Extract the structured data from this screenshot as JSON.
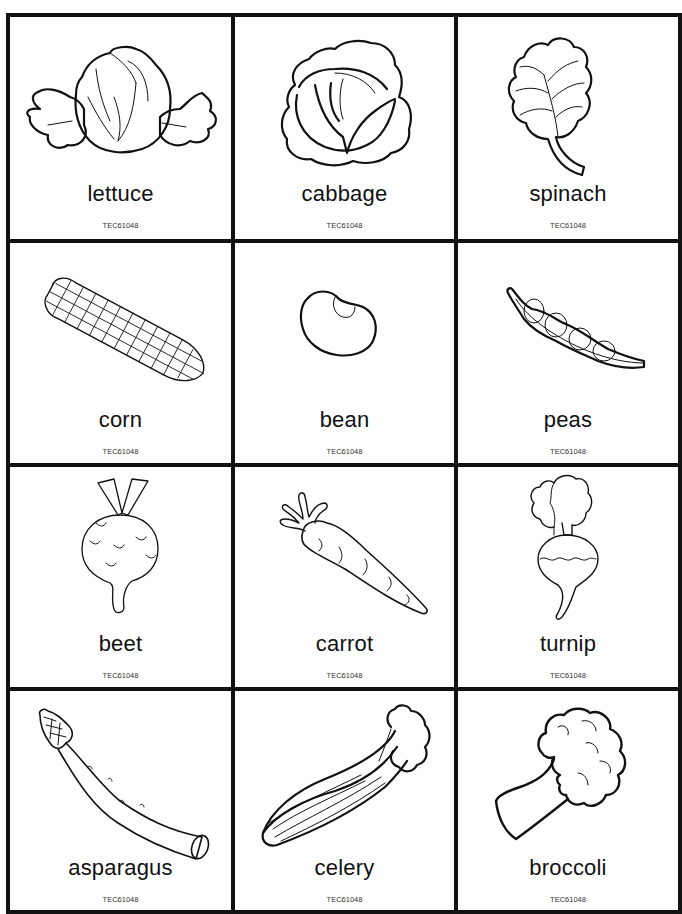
{
  "sheet": {
    "border_color": "#111111",
    "columns": 3,
    "rows": 4,
    "cards": [
      {
        "name": "lettuce",
        "label": "lettuce",
        "code": "TEC61048",
        "icon": "lettuce-icon"
      },
      {
        "name": "cabbage",
        "label": "cabbage",
        "code": "TEC61048",
        "icon": "cabbage-icon"
      },
      {
        "name": "spinach",
        "label": "spinach",
        "code": "TEC61048",
        "icon": "spinach-icon"
      },
      {
        "name": "corn",
        "label": "corn",
        "code": "TEC61048",
        "icon": "corn-icon"
      },
      {
        "name": "bean",
        "label": "bean",
        "code": "TEC61048",
        "icon": "bean-icon"
      },
      {
        "name": "peas",
        "label": "peas",
        "code": "TEC61048",
        "icon": "peas-icon"
      },
      {
        "name": "beet",
        "label": "beet",
        "code": "TEC61048",
        "icon": "beet-icon"
      },
      {
        "name": "carrot",
        "label": "carrot",
        "code": "TEC61048",
        "icon": "carrot-icon"
      },
      {
        "name": "turnip",
        "label": "turnip",
        "code": "TEC61048",
        "icon": "turnip-icon"
      },
      {
        "name": "asparagus",
        "label": "asparagus",
        "code": "TEC61048",
        "icon": "asparagus-icon"
      },
      {
        "name": "celery",
        "label": "celery",
        "code": "TEC61048",
        "icon": "celery-icon"
      },
      {
        "name": "broccoli",
        "label": "broccoli",
        "code": "TEC61048",
        "icon": "broccoli-icon"
      }
    ]
  }
}
